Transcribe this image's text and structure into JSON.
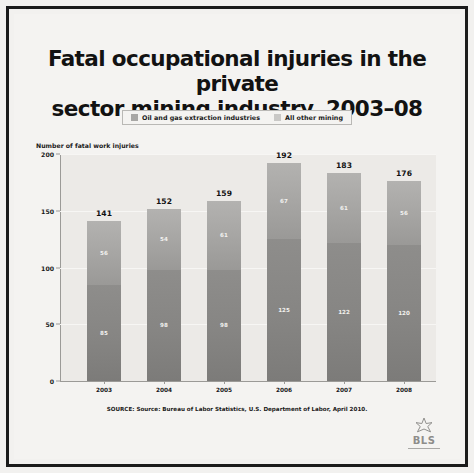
{
  "title": {
    "line1": "Fatal occupational injuries in the private",
    "line2": "sector mining industry, 2003–08"
  },
  "legend": {
    "items": [
      {
        "label": "Oil and gas extraction industries",
        "color": "#a8a7a5"
      },
      {
        "label": "All other mining",
        "color": "#c9c8c6"
      }
    ]
  },
  "axis_title": "Number of fatal work injuries",
  "source": "SOURCE: Source: Bureau of Labor Statistics, U.S. Department of Labor, April 2010.",
  "logo": {
    "text": "BLS",
    "star_icon": "star-icon"
  },
  "chart_data": {
    "type": "bar",
    "stacked": true,
    "title": "Fatal occupational injuries in the private sector mining industry, 2003–08",
    "xlabel": "",
    "ylabel": "Number of fatal work injuries",
    "ylim": [
      0,
      200
    ],
    "yticks": [
      0,
      50,
      100,
      150,
      200
    ],
    "grid": true,
    "legend_position": "top-center",
    "categories": [
      "2003",
      "2004",
      "2005",
      "2006",
      "2007",
      "2008"
    ],
    "series": [
      {
        "name": "All other mining",
        "values": [
          85,
          98,
          98,
          125,
          122,
          120
        ],
        "color": "#86857f"
      },
      {
        "name": "Oil and gas extraction industries",
        "values": [
          56,
          54,
          61,
          67,
          61,
          56
        ],
        "color": "#a8a7a5"
      }
    ],
    "totals": [
      141,
      152,
      159,
      192,
      183,
      176
    ]
  }
}
